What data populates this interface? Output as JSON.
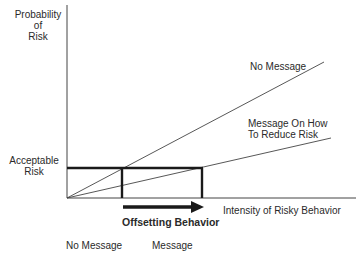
{
  "y_axis_label": [
    "Probability",
    "of",
    "Risk"
  ],
  "x_axis_label": "Intensity of Risky Behavior",
  "acceptable_risk_label": [
    "Acceptable",
    "Risk"
  ],
  "line_labels": {
    "no_message": "No Message",
    "message": [
      "Message On How",
      "To Reduce Risk"
    ]
  },
  "arrow_label": "Offsetting Behavior",
  "bottom_labels": {
    "no_message": "No Message",
    "message": "Message"
  },
  "colors": {
    "line": "#333333",
    "thick": "#1a1a1a",
    "background": "#ffffff"
  }
}
